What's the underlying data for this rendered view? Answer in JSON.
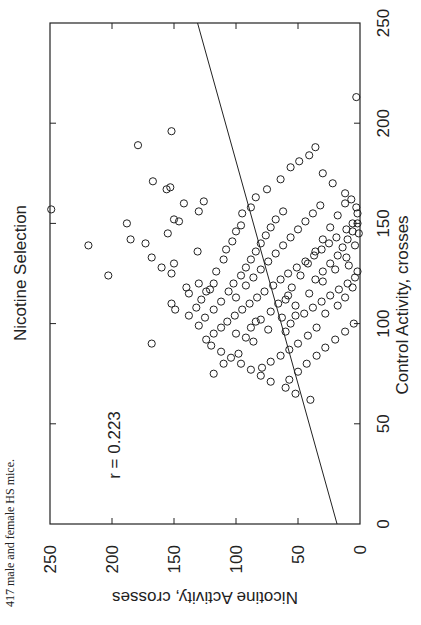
{
  "caption": "417 male and female HS mice.",
  "chart_data": {
    "type": "scatter",
    "title": "Nicotine Selection",
    "xlabel": "Control Activity, crosses",
    "ylabel": "Nicotine Activity, crosses",
    "xlim": [
      0,
      250
    ],
    "ylim": [
      0,
      250
    ],
    "xticks": [
      0,
      50,
      100,
      150,
      200,
      250
    ],
    "yticks": [
      0,
      50,
      100,
      150,
      200,
      250
    ],
    "grid": false,
    "legend": null,
    "orientation_note": "figure printed rotated 90 degrees clockwise on page",
    "annotation": "r = 0.223",
    "n": 417,
    "marker": "open-circle",
    "regression_line": {
      "x0": 0,
      "y0": 18.5,
      "x1": 250,
      "y1": 131,
      "slope": 0.45,
      "intercept": 18.5
    },
    "points": [
      [
        157,
        249
      ],
      [
        139,
        219
      ],
      [
        189,
        179
      ],
      [
        213,
        3
      ],
      [
        196,
        152
      ],
      [
        171,
        167
      ],
      [
        167,
        156
      ],
      [
        168,
        153
      ],
      [
        150,
        188
      ],
      [
        142,
        185
      ],
      [
        133,
        168
      ],
      [
        140,
        173
      ],
      [
        124,
        203
      ],
      [
        128,
        160
      ],
      [
        151,
        146
      ],
      [
        136,
        131
      ],
      [
        161,
        126
      ],
      [
        156,
        130
      ],
      [
        160,
        142
      ],
      [
        152,
        150
      ],
      [
        145,
        155
      ],
      [
        130,
        150
      ],
      [
        125,
        152
      ],
      [
        118,
        140
      ],
      [
        115,
        138
      ],
      [
        110,
        152
      ],
      [
        107,
        149
      ],
      [
        90,
        168
      ],
      [
        120,
        130
      ],
      [
        117,
        121
      ],
      [
        126,
        116
      ],
      [
        132,
        110
      ],
      [
        137,
        108
      ],
      [
        141,
        103
      ],
      [
        146,
        100
      ],
      [
        149,
        96
      ],
      [
        155,
        95
      ],
      [
        158,
        88
      ],
      [
        163,
        84
      ],
      [
        167,
        75
      ],
      [
        172,
        64
      ],
      [
        178,
        56
      ],
      [
        181,
        49
      ],
      [
        184,
        41
      ],
      [
        188,
        36
      ],
      [
        175,
        30
      ],
      [
        170,
        22
      ],
      [
        165,
        12
      ],
      [
        162,
        7
      ],
      [
        158,
        3
      ],
      [
        155,
        2
      ],
      [
        150,
        6
      ],
      [
        147,
        11
      ],
      [
        143,
        19
      ],
      [
        140,
        25
      ],
      [
        137,
        31
      ],
      [
        134,
        37
      ],
      [
        131,
        44
      ],
      [
        128,
        51
      ],
      [
        125,
        58
      ],
      [
        122,
        64
      ],
      [
        119,
        70
      ],
      [
        116,
        77
      ],
      [
        113,
        83
      ],
      [
        110,
        89
      ],
      [
        107,
        95
      ],
      [
        104,
        101
      ],
      [
        101,
        107
      ],
      [
        98,
        112
      ],
      [
        95,
        118
      ],
      [
        92,
        124
      ],
      [
        89,
        120
      ],
      [
        86,
        112
      ],
      [
        83,
        104
      ],
      [
        80,
        96
      ],
      [
        77,
        88
      ],
      [
        74,
        80
      ],
      [
        71,
        72
      ],
      [
        68,
        60
      ],
      [
        65,
        52
      ],
      [
        62,
        40
      ],
      [
        75,
        118
      ],
      [
        80,
        110
      ],
      [
        85,
        98
      ],
      [
        91,
        86
      ],
      [
        97,
        74
      ],
      [
        103,
        63
      ],
      [
        109,
        52
      ],
      [
        115,
        41
      ],
      [
        121,
        30
      ],
      [
        127,
        20
      ],
      [
        133,
        11
      ],
      [
        139,
        4
      ],
      [
        145,
        1
      ],
      [
        100,
        5
      ],
      [
        96,
        12
      ],
      [
        92,
        20
      ],
      [
        88,
        28
      ],
      [
        84,
        35
      ],
      [
        80,
        43
      ],
      [
        76,
        50
      ],
      [
        72,
        57
      ],
      [
        105,
        45
      ],
      [
        108,
        38
      ],
      [
        111,
        31
      ],
      [
        114,
        24
      ],
      [
        117,
        17
      ],
      [
        120,
        10
      ],
      [
        123,
        4
      ],
      [
        126,
        2
      ],
      [
        129,
        9
      ],
      [
        112,
        60
      ],
      [
        118,
        55
      ],
      [
        124,
        48
      ],
      [
        130,
        42
      ],
      [
        136,
        36
      ],
      [
        142,
        30
      ],
      [
        148,
        24
      ],
      [
        154,
        18
      ],
      [
        160,
        12
      ],
      [
        102,
        80
      ],
      [
        106,
        72
      ],
      [
        110,
        66
      ],
      [
        114,
        58
      ],
      [
        119,
        92
      ],
      [
        123,
        86
      ],
      [
        127,
        80
      ],
      [
        131,
        74
      ],
      [
        135,
        68
      ],
      [
        139,
        62
      ],
      [
        143,
        56
      ],
      [
        147,
        50
      ],
      [
        151,
        44
      ],
      [
        155,
        38
      ],
      [
        159,
        32
      ],
      [
        99,
        130
      ],
      [
        103,
        125
      ],
      [
        107,
        118
      ],
      [
        111,
        112
      ],
      [
        95,
        100
      ],
      [
        93,
        92
      ],
      [
        98,
        88
      ],
      [
        101,
        84
      ],
      [
        105,
        28
      ],
      [
        98,
        35
      ],
      [
        94,
        42
      ],
      [
        90,
        50
      ],
      [
        87,
        57
      ],
      [
        84,
        64
      ],
      [
        81,
        72
      ],
      [
        78,
        79
      ],
      [
        113,
        100
      ],
      [
        116,
        106
      ],
      [
        120,
        102
      ],
      [
        124,
        96
      ],
      [
        128,
        92
      ],
      [
        132,
        88
      ],
      [
        136,
        84
      ],
      [
        140,
        80
      ],
      [
        144,
        76
      ],
      [
        148,
        72
      ],
      [
        152,
        68
      ],
      [
        156,
        62
      ],
      [
        104,
        138
      ],
      [
        108,
        132
      ],
      [
        112,
        128
      ],
      [
        116,
        124
      ],
      [
        120,
        118
      ],
      [
        109,
        18
      ],
      [
        113,
        12
      ],
      [
        118,
        6
      ],
      [
        96,
        60
      ],
      [
        100,
        56
      ],
      [
        104,
        52
      ],
      [
        122,
        36
      ],
      [
        126,
        30
      ],
      [
        130,
        24
      ],
      [
        134,
        18
      ],
      [
        138,
        14
      ],
      [
        142,
        10
      ],
      [
        146,
        6
      ],
      [
        150,
        2
      ]
    ]
  }
}
